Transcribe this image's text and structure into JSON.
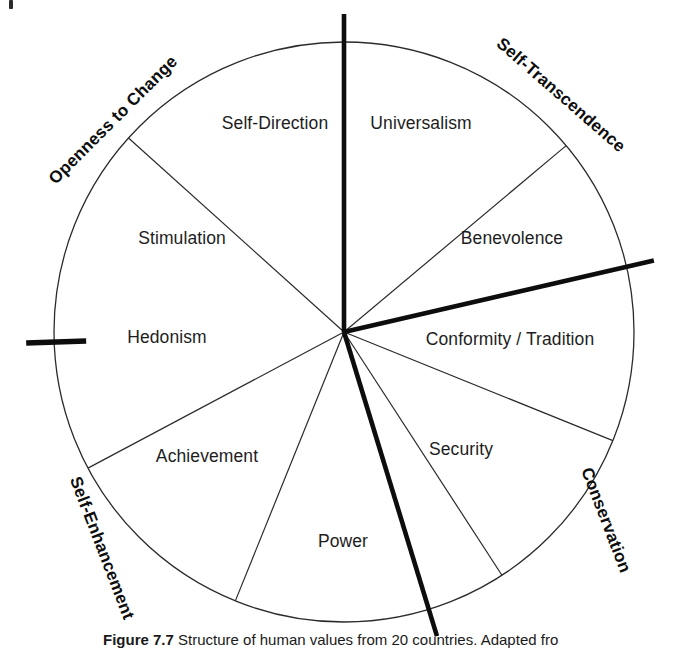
{
  "figure": {
    "title": "Structure of human values from 20 countries",
    "caption_prefix": "Figure 7.7",
    "caption_text": "Structure of human values from 20 countries. Adapted fro",
    "corner_mark": "page-edge-artifact"
  },
  "chart_data": {
    "type": "pie",
    "title": "Structure of human values from 20 countries",
    "subtitle": "",
    "xlabel": "",
    "ylabel": "",
    "legend_position": "around-circumference",
    "grid": false,
    "center": {
      "x": 344,
      "y": 332
    },
    "radius": 290,
    "categories": [
      "Self-Direction",
      "Universalism",
      "Benevolence",
      "Conformity / Tradition",
      "Security",
      "Power",
      "Achievement",
      "Hedonism",
      "Stimulation"
    ],
    "values": [
      48,
      50,
      27,
      35,
      35,
      37,
      40,
      48,
      40
    ],
    "segments": [
      {
        "label": "Self-Direction",
        "start_deg": 312,
        "end_deg": 360,
        "label_r": 0.62,
        "label_deg": 338,
        "x": 275,
        "y": 124
      },
      {
        "label": "Universalism",
        "start_deg": 0,
        "end_deg": 50,
        "label_r": 0.62,
        "label_deg": 22,
        "x": 421,
        "y": 124
      },
      {
        "label": "Benevolence",
        "start_deg": 50,
        "end_deg": 77,
        "label_r": 0.7,
        "label_deg": 64,
        "x": 512,
        "y": 239
      },
      {
        "label": "Conformity / Tradition",
        "start_deg": 77,
        "end_deg": 112,
        "label_r": 0.68,
        "label_deg": 96,
        "x": 510,
        "y": 340
      },
      {
        "label": "Security",
        "start_deg": 112,
        "end_deg": 147,
        "label_r": 0.58,
        "label_deg": 130,
        "x": 461,
        "y": 450
      },
      {
        "label": "Power",
        "start_deg": 147,
        "end_deg": 202,
        "label_r": 0.62,
        "label_deg": 175,
        "x": 343,
        "y": 542
      },
      {
        "label": "Achievement",
        "start_deg": 202,
        "end_deg": 242,
        "label_r": 0.62,
        "label_deg": 222,
        "x": 207,
        "y": 457
      },
      {
        "label": "Hedonism",
        "start_deg": 242,
        "end_deg": 268,
        "label_r": 0.65,
        "label_deg": 255,
        "x": 167,
        "y": 338
      },
      {
        "label": "Stimulation",
        "start_deg": 268,
        "end_deg": 312,
        "label_r": 0.62,
        "label_deg": 290,
        "x": 182,
        "y": 239
      }
    ],
    "higher_order_dimensions": [
      {
        "label": "Openness to Change",
        "x": 113,
        "y": 120,
        "rotation": -45
      },
      {
        "label": "Self-Transcendence",
        "x": 561,
        "y": 95,
        "rotation": 41
      },
      {
        "label": "Conservation",
        "x": 606,
        "y": 520,
        "rotation": 69
      },
      {
        "label": "Self-Enhancement",
        "x": 102,
        "y": 548,
        "rotation": 69
      }
    ],
    "axes": [
      {
        "name": "self-direction-universalism-axis",
        "angle_deg": 0,
        "weight": "thick",
        "overshoot": 28
      },
      {
        "name": "benevolence-conformity-axis",
        "angle_deg": 77,
        "weight": "thick",
        "overshoot": 28
      },
      {
        "name": "security-power-axis",
        "angle_deg": 163,
        "weight": "thick",
        "overshoot": 28
      },
      {
        "name": "hedonism-stimulation-axis",
        "angle_deg": 268,
        "weight": "thick",
        "overshoot": 28
      }
    ],
    "spokes": [
      {
        "name": "universalism-benevolence-spoke",
        "angle_deg": 50,
        "weight": "thin"
      },
      {
        "name": "conformity-security-spoke",
        "angle_deg": 112,
        "weight": "thin"
      },
      {
        "name": "security-power-spoke",
        "angle_deg": 147,
        "weight": "thin"
      },
      {
        "name": "power-achievement-spoke",
        "angle_deg": 202,
        "weight": "thin"
      },
      {
        "name": "achievement-hedonism-spoke",
        "angle_deg": 242,
        "weight": "thin"
      },
      {
        "name": "stimulation-selfdirection-spoke",
        "angle_deg": 312,
        "weight": "thin"
      }
    ],
    "colors": {
      "background": "#ffffff",
      "outline": "#2b2b2b",
      "thin_line": "#2b2b2b",
      "thick_line": "#0d0d0d",
      "text": "#1d1d1d",
      "dimension_text": "#0d0d0d"
    }
  }
}
